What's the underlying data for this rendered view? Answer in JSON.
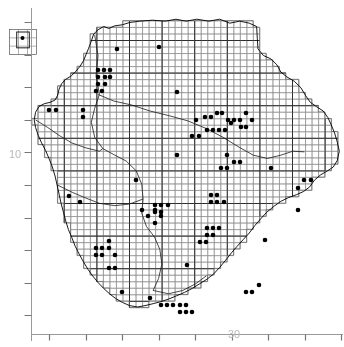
{
  "figure": {
    "type": "distribution-atlas-map",
    "title": "",
    "background_color": "#ffffff",
    "line_color": "#000000",
    "grid_color": "#8f8f8f",
    "dot_color": "#000000",
    "axis_color": "#9a9a9a",
    "label_color": "#b9b9b9",
    "width": 344,
    "height": 347
  },
  "axes": {
    "y_axis": {
      "name": "vertical-axis",
      "x_px": 31,
      "top_px": 8,
      "bottom_px": 341,
      "tick_labels": [
        "10"
      ],
      "tick_values": [
        10
      ],
      "tick_positions_px": [
        155
      ],
      "tick_spacing_px": 32.6,
      "tick_count": 11,
      "tick_length_px": 7
    },
    "x_axis": {
      "name": "horizontal-axis",
      "y_px": 334,
      "left_px": 31,
      "right_px": 343,
      "tick_labels": [
        "30"
      ],
      "tick_values": [
        30
      ],
      "tick_positions_px": [
        231
      ],
      "tick_spacing_px": 36.5,
      "tick_count": 9,
      "tick_length_px": 6
    }
  },
  "inset": {
    "name": "island-inset-box",
    "x": 9,
    "y": 29,
    "w": 27,
    "h": 25,
    "cols": 3,
    "rows": 3,
    "dots": [
      [
        1.5,
        0.6
      ]
    ]
  },
  "grid": {
    "cell_px": 6.52,
    "heavy_every": 5,
    "origin_x_px": 31.4,
    "origin_y_px": 7.6
  },
  "chart_data": {
    "type": "scatter",
    "title": "",
    "xlabel": "",
    "ylabel": "",
    "grid": true,
    "legend": null,
    "x_tick_labels": [
      "30"
    ],
    "y_tick_labels": [
      "10"
    ],
    "point_count": 93,
    "marker": "filled-circle",
    "marker_size_px": 4.6,
    "points": [
      [
        117,
        49
      ],
      [
        159,
        47
      ],
      [
        98,
        70
      ],
      [
        104,
        70
      ],
      [
        110,
        70
      ],
      [
        98,
        77
      ],
      [
        105,
        77
      ],
      [
        110,
        77
      ],
      [
        98,
        84
      ],
      [
        105,
        84
      ],
      [
        96,
        91
      ],
      [
        102,
        91
      ],
      [
        49,
        110
      ],
      [
        56,
        110
      ],
      [
        83,
        110
      ],
      [
        83,
        117
      ],
      [
        240,
        120
      ],
      [
        246,
        113
      ],
      [
        252,
        120
      ],
      [
        177,
        92
      ],
      [
        196,
        120
      ],
      [
        205,
        117
      ],
      [
        211,
        117
      ],
      [
        217,
        113
      ],
      [
        222,
        113
      ],
      [
        228,
        120
      ],
      [
        234,
        120
      ],
      [
        241,
        127
      ],
      [
        246,
        127
      ],
      [
        207,
        130
      ],
      [
        213,
        130
      ],
      [
        219,
        130
      ],
      [
        225,
        130
      ],
      [
        231,
        123
      ],
      [
        192,
        136
      ],
      [
        199,
        136
      ],
      [
        136,
        180
      ],
      [
        177,
        155
      ],
      [
        227,
        155
      ],
      [
        234,
        162
      ],
      [
        240,
        162
      ],
      [
        221,
        168
      ],
      [
        227,
        168
      ],
      [
        271,
        168
      ],
      [
        155,
        205
      ],
      [
        161,
        205
      ],
      [
        155,
        212
      ],
      [
        161,
        212
      ],
      [
        168,
        205
      ],
      [
        211,
        195
      ],
      [
        217,
        195
      ],
      [
        211,
        202
      ],
      [
        217,
        202
      ],
      [
        224,
        202
      ],
      [
        304,
        180
      ],
      [
        311,
        180
      ],
      [
        298,
        188
      ],
      [
        187,
        265
      ],
      [
        96,
        248
      ],
      [
        102,
        248
      ],
      [
        109,
        248
      ],
      [
        96,
        255
      ],
      [
        102,
        255
      ],
      [
        109,
        241
      ],
      [
        115,
        255
      ],
      [
        109,
        268
      ],
      [
        115,
        268
      ],
      [
        207,
        228
      ],
      [
        213,
        228
      ],
      [
        207,
        235
      ],
      [
        213,
        235
      ],
      [
        219,
        228
      ],
      [
        200,
        242
      ],
      [
        206,
        242
      ],
      [
        161,
        305
      ],
      [
        167,
        305
      ],
      [
        173,
        305
      ],
      [
        180,
        305
      ],
      [
        186,
        312
      ],
      [
        192,
        312
      ],
      [
        180,
        312
      ],
      [
        186,
        305
      ],
      [
        246,
        292
      ],
      [
        252,
        292
      ],
      [
        259,
        285
      ],
      [
        122,
        292
      ],
      [
        150,
        298
      ],
      [
        69,
        196
      ],
      [
        80,
        202
      ],
      [
        142,
        210
      ],
      [
        148,
        216
      ],
      [
        155,
        210
      ],
      [
        161,
        216
      ],
      [
        155,
        223
      ],
      [
        265,
        240
      ],
      [
        298,
        210
      ]
    ]
  },
  "map_outline": {
    "name": "region-coastline",
    "description": "irregular coastal boundary polygon"
  }
}
